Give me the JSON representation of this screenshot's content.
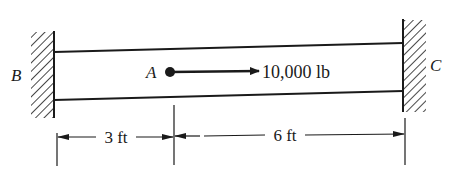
{
  "diagram": {
    "type": "beam-with-fixed-supports",
    "supports": [
      {
        "id": "left",
        "label": "B",
        "kind": "fixed-wall"
      },
      {
        "id": "right",
        "label": "C",
        "kind": "fixed-wall"
      }
    ],
    "load": {
      "point_label": "A",
      "value": "10,000 lb",
      "direction": "right"
    },
    "dimensions": [
      {
        "label": "3 ft",
        "from": "B",
        "to": "A"
      },
      {
        "label": "6 ft",
        "from": "A",
        "to": "C"
      }
    ]
  },
  "colors": {
    "ink": "#1a1a1a",
    "background": "#ffffff"
  }
}
